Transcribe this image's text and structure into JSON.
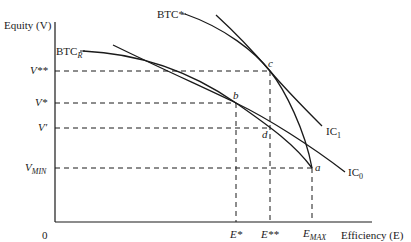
{
  "figure": {
    "y_axis_label": "Equity (V)",
    "x_axis_label": "Efficiency (E)",
    "origin_label": "0",
    "y_ticks": [
      {
        "key": "v_double_star",
        "label": "V**"
      },
      {
        "key": "v_star",
        "label": "V*"
      },
      {
        "key": "v_prime",
        "label": "V′"
      },
      {
        "key": "v_min",
        "label": "V",
        "sub": "MIN"
      }
    ],
    "x_ticks": [
      {
        "key": "e_star",
        "label": "E*"
      },
      {
        "key": "e_double_star",
        "label": "E**"
      },
      {
        "key": "e_max",
        "label": "E",
        "sub": "MAX"
      }
    ],
    "curves": [
      {
        "key": "btc_r",
        "label": "BTC",
        "sub": "R",
        "kind": "bargaining trade-off curve (restricted)"
      },
      {
        "key": "btc_star",
        "label": "BTC*",
        "kind": "bargaining trade-off curve"
      },
      {
        "key": "ic_1",
        "label": "IC",
        "sub": "1",
        "kind": "indifference curve"
      },
      {
        "key": "ic_0",
        "label": "IC",
        "sub": "0",
        "kind": "indifference curve"
      }
    ],
    "points": [
      {
        "key": "a",
        "label": "a",
        "at": [
          "E_MAX",
          "V_MIN"
        ]
      },
      {
        "key": "b",
        "label": "b",
        "at": [
          "E*",
          "V*"
        ]
      },
      {
        "key": "c",
        "label": "c",
        "at": [
          "E**",
          "V**"
        ]
      },
      {
        "key": "d",
        "label": "d",
        "at": [
          "E**",
          "V′"
        ]
      }
    ]
  },
  "labels": {
    "y_axis": "Equity (V)",
    "x_axis": "Efficiency (E)",
    "origin": "0",
    "v_double_star": "V**",
    "v_star": "V*",
    "v_prime": "V′",
    "v_min_main": "V",
    "v_min_sub": "MIN",
    "e_star": "E*",
    "e_double_star": "E**",
    "e_max_main": "E",
    "e_max_sub": "MAX",
    "btc_r_main": "BTC",
    "btc_r_sub": "R",
    "btc_star": "BTC*",
    "ic1_main": "IC",
    "ic1_sub": "1",
    "ic0_main": "IC",
    "ic0_sub": "0",
    "pt_a": "a",
    "pt_b": "b",
    "pt_c": "c",
    "pt_d": "d"
  },
  "colors": {
    "ink": "#1a1a1a",
    "background": "#ffffff"
  }
}
